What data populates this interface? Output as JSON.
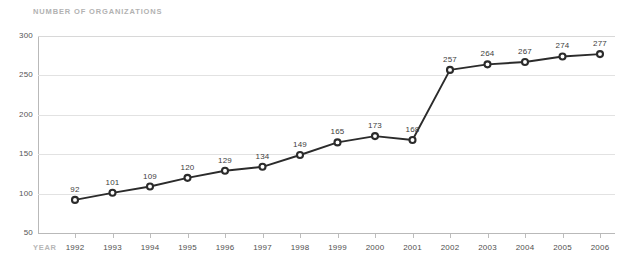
{
  "chart_data": {
    "type": "line",
    "title": "NUMBER OF ORGANIZATIONS",
    "xlabel": "YEAR",
    "ylabel": "",
    "categories": [
      "1992",
      "1993",
      "1994",
      "1995",
      "1996",
      "1997",
      "1998",
      "1999",
      "2000",
      "2001",
      "2002",
      "2003",
      "2004",
      "2005",
      "2006"
    ],
    "values": [
      92,
      101,
      109,
      120,
      129,
      134,
      149,
      165,
      173,
      168,
      257,
      264,
      267,
      274,
      277
    ],
    "value_labels": [
      "92",
      "101",
      "109",
      "120",
      "129",
      "134",
      "149",
      "165",
      "173",
      "168",
      "257",
      "264",
      "267",
      "274",
      "277"
    ],
    "ylim": [
      50,
      300
    ],
    "yticks": [
      50,
      100,
      150,
      200,
      250,
      300
    ],
    "ytick_labels": [
      "50",
      "100",
      "150",
      "200",
      "250",
      "300"
    ],
    "grid": true,
    "legend": false,
    "legend_position": "none",
    "series": [
      {
        "name": "Number of organizations",
        "values": [
          92,
          101,
          109,
          120,
          129,
          134,
          149,
          165,
          173,
          168,
          257,
          264,
          267,
          274,
          277
        ]
      }
    ],
    "colors": {
      "line": "#2b2b2b",
      "marker_fill": "#ffffff",
      "marker_stroke": "#2b2b2b",
      "grid": "#e2e2e2",
      "axis": "#b9b9b9",
      "title_text": "#b2b2b2",
      "tick_text": "#4f4f4f",
      "label_text": "#3d3d3d",
      "background": "#ffffff"
    }
  }
}
